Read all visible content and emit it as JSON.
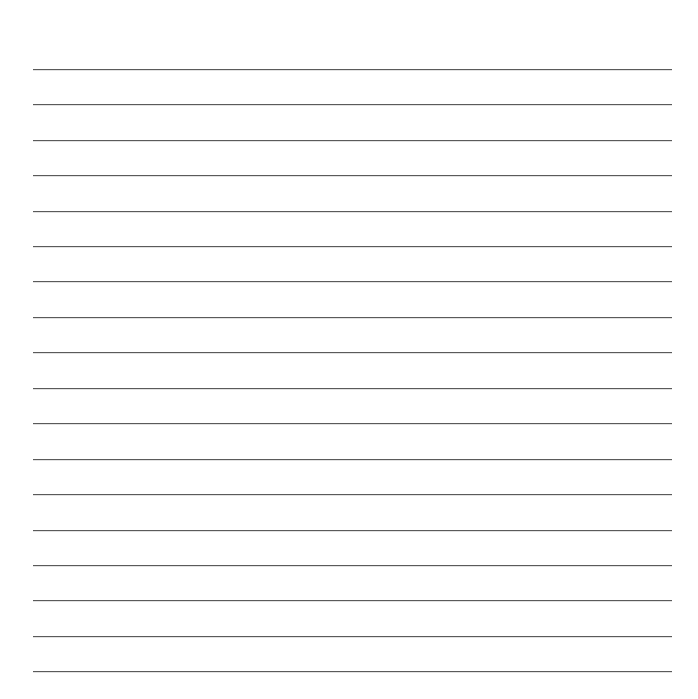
{
  "document": {
    "type": "lined-paper",
    "line_count": 18,
    "line_color": "#5a5a5a",
    "line_left": 33,
    "line_right": 672,
    "line_positions": [
      69,
      104,
      140,
      175,
      211,
      246,
      281,
      317,
      352,
      388,
      423,
      459,
      494,
      530,
      565,
      600,
      636,
      671
    ]
  }
}
